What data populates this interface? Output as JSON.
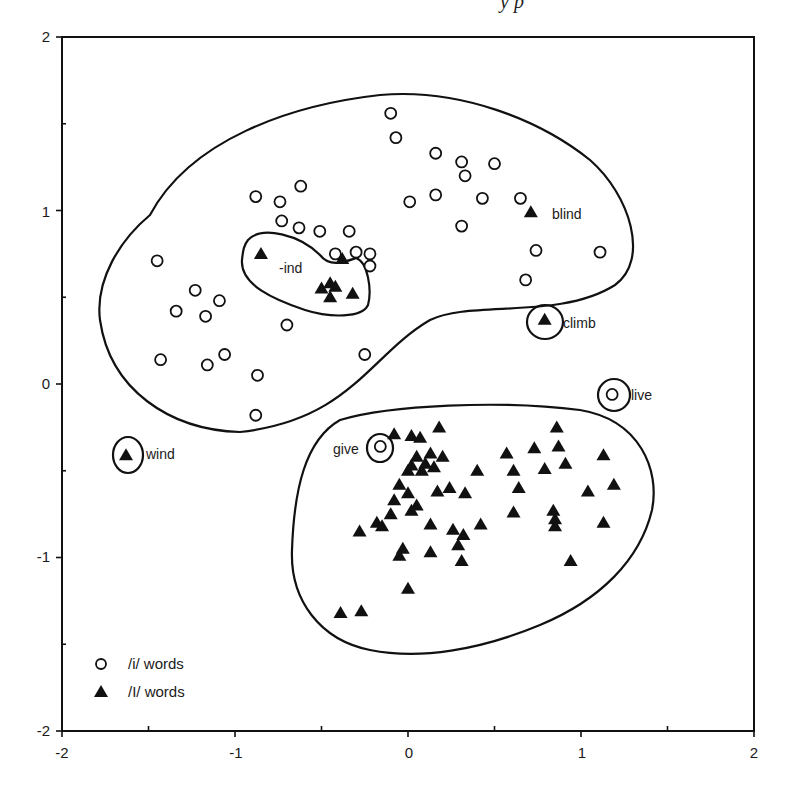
{
  "header": {
    "fragment": "y        p"
  },
  "chart_data": {
    "type": "scatter",
    "title": "",
    "xlabel": "",
    "ylabel": "",
    "xlim": [
      -2,
      2
    ],
    "ylim": [
      -2,
      2
    ],
    "x_ticks": [
      "-2",
      "-1",
      "0",
      "1",
      "2"
    ],
    "y_ticks": [
      "-2",
      "-1",
      "0",
      "1",
      "2"
    ],
    "grid": false,
    "legend_position": "bottom-left",
    "legend": [
      {
        "marker": "open-circle",
        "label": "/i/ words"
      },
      {
        "marker": "filled-triangle",
        "label": "/I/ words"
      }
    ],
    "series": [
      {
        "name": "/i/ words",
        "marker": "open-circle",
        "points": [
          [
            -0.1,
            1.56
          ],
          [
            -0.07,
            1.42
          ],
          [
            0.16,
            1.33
          ],
          [
            0.31,
            1.28
          ],
          [
            0.5,
            1.27
          ],
          [
            0.33,
            1.2
          ],
          [
            0.16,
            1.09
          ],
          [
            0.01,
            1.05
          ],
          [
            0.43,
            1.07
          ],
          [
            0.65,
            1.07
          ],
          [
            0.31,
            0.91
          ],
          [
            0.74,
            0.77
          ],
          [
            0.68,
            0.6
          ],
          [
            1.11,
            0.76
          ],
          [
            -0.88,
            1.08
          ],
          [
            -0.62,
            1.14
          ],
          [
            -0.74,
            1.05
          ],
          [
            -0.73,
            0.94
          ],
          [
            -0.63,
            0.9
          ],
          [
            -0.51,
            0.88
          ],
          [
            -0.34,
            0.88
          ],
          [
            -0.42,
            0.75
          ],
          [
            -0.3,
            0.76
          ],
          [
            -0.22,
            0.75
          ],
          [
            -0.22,
            0.68
          ],
          [
            -1.45,
            0.71
          ],
          [
            -1.23,
            0.54
          ],
          [
            -1.09,
            0.48
          ],
          [
            -1.34,
            0.42
          ],
          [
            -1.17,
            0.39
          ],
          [
            -0.7,
            0.34
          ],
          [
            -1.06,
            0.17
          ],
          [
            -1.43,
            0.14
          ],
          [
            -1.16,
            0.11
          ],
          [
            -0.25,
            0.17
          ],
          [
            -0.87,
            0.05
          ],
          [
            -0.88,
            -0.18
          ],
          [
            -0.16,
            -0.36
          ],
          [
            1.18,
            -0.06
          ]
        ]
      },
      {
        "name": "/I/ words",
        "marker": "filled-triangle",
        "points": [
          [
            -0.85,
            0.75
          ],
          [
            -0.38,
            0.72
          ],
          [
            -0.45,
            0.58
          ],
          [
            -0.5,
            0.55
          ],
          [
            -0.45,
            0.5
          ],
          [
            -0.32,
            0.52
          ],
          [
            -0.42,
            0.56
          ],
          [
            0.71,
            0.99
          ],
          [
            0.79,
            0.37
          ],
          [
            -1.63,
            -0.41
          ],
          [
            -0.08,
            -0.29
          ],
          [
            0.02,
            -0.3
          ],
          [
            0.07,
            -0.31
          ],
          [
            0.18,
            -0.25
          ],
          [
            0.05,
            -0.42
          ],
          [
            0.13,
            -0.4
          ],
          [
            0.2,
            -0.42
          ],
          [
            0.1,
            -0.46
          ],
          [
            0.02,
            -0.47
          ],
          [
            0.0,
            -0.5
          ],
          [
            0.08,
            -0.5
          ],
          [
            0.15,
            -0.48
          ],
          [
            -0.05,
            -0.58
          ],
          [
            0.0,
            -0.63
          ],
          [
            0.17,
            -0.62
          ],
          [
            0.24,
            -0.6
          ],
          [
            0.33,
            -0.63
          ],
          [
            0.4,
            -0.5
          ],
          [
            -0.08,
            -0.67
          ],
          [
            -0.1,
            -0.75
          ],
          [
            0.02,
            -0.73
          ],
          [
            0.05,
            -0.7
          ],
          [
            0.13,
            -0.81
          ],
          [
            0.26,
            -0.84
          ],
          [
            0.32,
            -0.87
          ],
          [
            0.42,
            -0.81
          ],
          [
            -0.18,
            -0.8
          ],
          [
            -0.15,
            -0.82
          ],
          [
            -0.28,
            -0.85
          ],
          [
            -0.03,
            -0.95
          ],
          [
            -0.05,
            -0.99
          ],
          [
            0.13,
            -0.97
          ],
          [
            0.31,
            -1.02
          ],
          [
            0.29,
            -0.93
          ],
          [
            0.0,
            -1.18
          ],
          [
            -0.27,
            -1.31
          ],
          [
            -0.39,
            -1.32
          ],
          [
            0.57,
            -0.4
          ],
          [
            0.73,
            -0.37
          ],
          [
            0.86,
            -0.25
          ],
          [
            0.87,
            -0.36
          ],
          [
            0.61,
            -0.5
          ],
          [
            0.79,
            -0.49
          ],
          [
            0.64,
            -0.6
          ],
          [
            0.91,
            -0.46
          ],
          [
            1.13,
            -0.41
          ],
          [
            1.04,
            -0.62
          ],
          [
            1.19,
            -0.58
          ],
          [
            0.61,
            -0.74
          ],
          [
            0.84,
            -0.73
          ],
          [
            0.85,
            -0.78
          ],
          [
            0.85,
            -0.82
          ],
          [
            1.13,
            -0.8
          ],
          [
            0.94,
            -1.02
          ]
        ]
      }
    ],
    "annotations": [
      {
        "text": "-ind",
        "type": "cluster-label",
        "at": [
          -0.73,
          0.66
        ]
      },
      {
        "text": "blind",
        "at": [
          0.71,
          0.99
        ]
      },
      {
        "text": "climb",
        "at": [
          0.79,
          0.37
        ],
        "circled": true
      },
      {
        "text": "live",
        "at": [
          1.18,
          -0.06
        ],
        "circled": true
      },
      {
        "text": "give",
        "at": [
          -0.16,
          -0.36
        ],
        "circled": true
      },
      {
        "text": "wind",
        "at": [
          -1.63,
          -0.41
        ],
        "circled": true
      }
    ],
    "regions": [
      {
        "name": "upper-cluster",
        "description": "large enclosing contour around most /i/ words"
      },
      {
        "name": "ind-cluster",
        "description": "small contour around -ind /I/ words"
      },
      {
        "name": "lower-cluster",
        "description": "enclosing contour around most /I/ words"
      }
    ]
  }
}
